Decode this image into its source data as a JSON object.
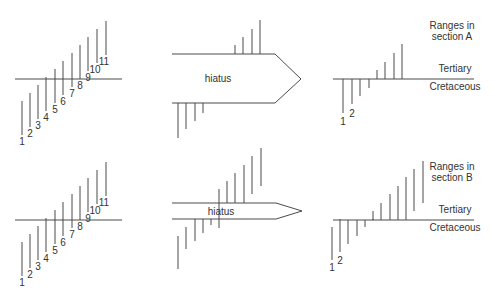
{
  "diagram": {
    "type": "stratigraphic range diagram",
    "hiatus_label": "hiatus",
    "boundary_upper": "Tertiary",
    "boundary_lower": "Cretaceous",
    "taxa_labels": [
      "1",
      "2",
      "3",
      "4",
      "5",
      "6",
      "7",
      "8",
      "9",
      "10",
      "11"
    ],
    "sections": [
      {
        "title_line1": "Ranges in",
        "title_line2": "section A",
        "hiatus_size": "large",
        "visible_labels": [
          "1",
          "2"
        ]
      },
      {
        "title_line1": "Ranges in",
        "title_line2": "section B",
        "hiatus_size": "small",
        "visible_labels": [
          "1",
          "2"
        ]
      }
    ]
  }
}
